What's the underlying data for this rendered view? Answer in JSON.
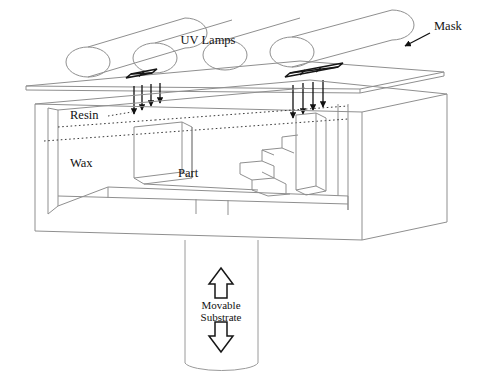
{
  "figure": {
    "background_color": "#ffffff",
    "line_color": "#8a8a8a",
    "dark_line_color": "#1a1a1a",
    "text_color": "#121212"
  },
  "labels": {
    "uv_lamps": "UV Lamps",
    "mask": "Mask",
    "resin": "Resin",
    "wax": "Wax",
    "part": "Part",
    "movable_substrate_line1": "Movable",
    "movable_substrate_line2": "Substrate"
  },
  "components": {
    "uv_lamps": {
      "name": "UV Lamps",
      "count": 4,
      "shape": "cylinder",
      "arrangement": "diagonal row above mask"
    },
    "mask": {
      "name": "Mask",
      "shape": "thin flat plate",
      "aperture_count": 2,
      "apertures": [
        {
          "position": "left",
          "divisions": 2
        },
        {
          "position": "right",
          "divisions": 3
        }
      ],
      "callout_arrow": "points down-left from Mask label to plate"
    },
    "uv_beams": {
      "name": "UV light beams",
      "groups": 2,
      "arrows_per_group": 4,
      "direction": "downward"
    },
    "vat": {
      "name": "Resin and wax vat",
      "layers": [
        "Resin",
        "Wax"
      ],
      "resin_surface": "dotted line"
    },
    "part": {
      "name": "Part",
      "profile": "block with descending staircase on right",
      "step_count": 4
    },
    "substrate": {
      "name": "Movable Substrate",
      "shape": "vertical column",
      "motion_arrows": [
        "up",
        "down"
      ]
    }
  }
}
